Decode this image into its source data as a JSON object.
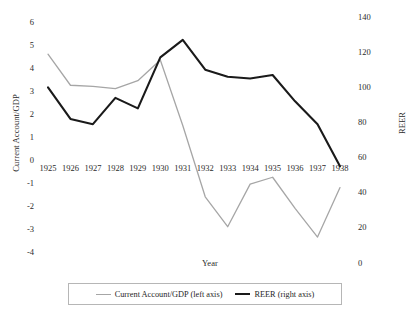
{
  "chart_data": {
    "type": "line",
    "title": "",
    "xlabel": "Year",
    "ylabel": "Current Account/GDP",
    "y2label": "REER",
    "categories": [
      "1925",
      "1926",
      "1927",
      "1928",
      "1929",
      "1930",
      "1931",
      "1932",
      "1933",
      "1934",
      "1935",
      "1936",
      "1937",
      "1938"
    ],
    "ylim": [
      -4,
      6
    ],
    "yticks": [
      "6",
      "5",
      "4",
      "3",
      "2",
      "1",
      "0",
      "-1",
      "-2",
      "-3",
      "-4"
    ],
    "ytick_values": [
      6,
      5,
      4,
      3,
      2,
      1,
      0,
      -1,
      -2,
      -3,
      -4
    ],
    "y2lim": [
      0,
      140
    ],
    "y2ticks": [
      "140",
      "120",
      "100",
      "80",
      "60",
      "40",
      "20",
      "0"
    ],
    "y2tick_values": [
      140,
      120,
      100,
      80,
      60,
      40,
      20,
      0
    ],
    "grid": false,
    "legend_position": "bottom",
    "series": [
      {
        "name": "Current Account/GDP (left axis)",
        "axis": "left",
        "color": "#a6a6a6",
        "values": [
          4.6,
          3.25,
          3.2,
          3.1,
          3.45,
          4.35,
          1.5,
          -1.6,
          -2.9,
          -1.05,
          -0.75,
          -2.1,
          -3.35,
          -1.2
        ]
      },
      {
        "name": "REER (right axis)",
        "axis": "right",
        "color": "#1a1a1a",
        "values": [
          100,
          82,
          79,
          94,
          88,
          117,
          127,
          110,
          106,
          105,
          107,
          92,
          79,
          55
        ]
      }
    ]
  },
  "legend": {
    "items": [
      {
        "label": "Current Account/GDP (left axis)",
        "swatch": "ca"
      },
      {
        "label": "REER (right axis)",
        "swatch": "reer"
      }
    ]
  }
}
